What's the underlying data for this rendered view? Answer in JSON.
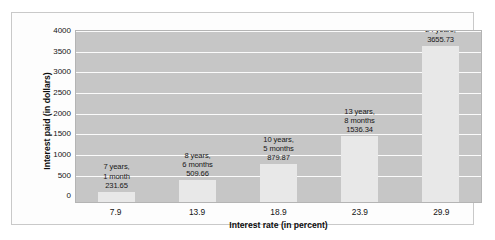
{
  "chart_data": {
    "type": "bar",
    "title": "",
    "xlabel": "Interest rate (in percent)",
    "ylabel": "Interest paid (in dollars)",
    "categories": [
      "7.9",
      "13.9",
      "18.9",
      "23.9",
      "29.9"
    ],
    "values": [
      231.65,
      509.66,
      879.87,
      1536.34,
      3655.73
    ],
    "ylim": [
      0,
      4000
    ],
    "ytick_labels": [
      "4000",
      "3500",
      "3000",
      "2500",
      "2000",
      "1500",
      "1000",
      "500",
      "0"
    ],
    "ytick_values": [
      4000,
      3500,
      3000,
      2500,
      2000,
      1500,
      1000,
      500,
      0
    ],
    "grid": true,
    "legend": "none",
    "annotations": [
      {
        "line1": "7 years,",
        "line2": "1 month",
        "line3": "231.65"
      },
      {
        "line1": "8 years,",
        "line2": "6 months",
        "line3": "509.66"
      },
      {
        "line1": "10 years,",
        "line2": "5 months",
        "line3": "879.87"
      },
      {
        "line1": "13 years,",
        "line2": "8 months",
        "line3": "1536.34"
      },
      {
        "line1": "24 years,",
        "line2": "",
        "line3": "3655.73"
      }
    ],
    "colors": {
      "bar": "#e8e8e8",
      "plot_background": "#c6c6c6",
      "gridline": "#fbfbfb",
      "figure_background": "#ffffff",
      "text": "#141414"
    }
  }
}
